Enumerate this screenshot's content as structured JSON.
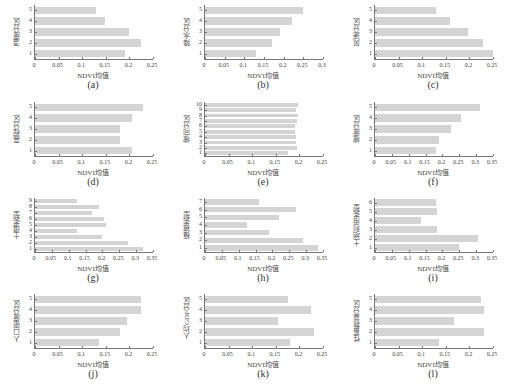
{
  "chart_data": [
    {
      "id": "a",
      "type": "bar",
      "orientation": "horizontal",
      "caption": "(a)",
      "ylabel": "温度分区",
      "xlabel": "NDVI均值",
      "xlim": [
        0,
        0.25
      ],
      "xticks": [
        "0",
        "0.05",
        "0.1",
        "0.15",
        "0.2",
        "0.25"
      ],
      "categories": [
        "1",
        "2",
        "3",
        "4",
        "5"
      ],
      "values": [
        0.19,
        0.225,
        0.2,
        0.148,
        0.13
      ]
    },
    {
      "id": "b",
      "type": "bar",
      "orientation": "horizontal",
      "caption": "(b)",
      "ylabel": "降水分区",
      "xlabel": "NDVI均值",
      "xlim": [
        0,
        0.3
      ],
      "xticks": [
        "0",
        "0.05",
        "0.1",
        "0.15",
        "0.2",
        "0.25",
        "0.3"
      ],
      "categories": [
        "1",
        "2",
        "3",
        "4",
        "5"
      ],
      "values": [
        0.13,
        0.17,
        0.19,
        0.22,
        0.25
      ]
    },
    {
      "id": "c",
      "type": "bar",
      "orientation": "horizontal",
      "caption": "(c)",
      "ylabel": "风速分区",
      "xlabel": "NDVI均值",
      "xlim": [
        0,
        0.25
      ],
      "xticks": [
        "0",
        "0.05",
        "0.1",
        "0.15",
        "0.2",
        "0.25"
      ],
      "categories": [
        "1",
        "2",
        "3",
        "4",
        "5"
      ],
      "values": [
        0.25,
        0.228,
        0.198,
        0.158,
        0.13
      ]
    },
    {
      "id": "d",
      "type": "bar",
      "orientation": "horizontal",
      "caption": "(d)",
      "ylabel": "高程分区",
      "xlabel": "NDVI均值",
      "xlim": [
        0,
        0.25
      ],
      "xticks": [
        "0",
        "0.05",
        "0.1",
        "0.15",
        "0.2",
        "0.25"
      ],
      "categories": [
        "1",
        "2",
        "3",
        "4",
        "5"
      ],
      "values": [
        0.205,
        0.18,
        0.18,
        0.205,
        0.228
      ]
    },
    {
      "id": "e",
      "type": "bar",
      "orientation": "horizontal",
      "caption": "(e)",
      "ylabel": "坡向分区",
      "xlabel": "NDVI均值",
      "xlim": [
        0,
        0.25
      ],
      "xticks": [
        "0",
        "0.05",
        "0.1",
        "0.15",
        "0.2",
        "0.25"
      ],
      "categories": [
        "1",
        "2",
        "3",
        "4",
        "5",
        "6",
        "7",
        "8",
        "9",
        "10"
      ],
      "values": [
        0.175,
        0.195,
        0.192,
        0.193,
        0.19,
        0.19,
        0.195,
        0.198,
        0.192,
        0.198
      ]
    },
    {
      "id": "f",
      "type": "bar",
      "orientation": "horizontal",
      "caption": "(f)",
      "ylabel": "坡度分区",
      "xlabel": "NDVI均值",
      "xlim": [
        0,
        0.35
      ],
      "xticks": [
        "0",
        "0.05",
        "0.1",
        "0.15",
        "0.2",
        "0.25",
        "0.3",
        "0.35"
      ],
      "categories": [
        "1",
        "2",
        "3",
        "4",
        "5"
      ],
      "values": [
        0.18,
        0.19,
        0.225,
        0.255,
        0.31
      ]
    },
    {
      "id": "g",
      "type": "bar",
      "orientation": "horizontal",
      "caption": "(g)",
      "ylabel": "土壤类型",
      "xlabel": "NDVI均值",
      "xlim": [
        0,
        0.35
      ],
      "xticks": [
        "0",
        "0.05",
        "0.1",
        "0.15",
        "0.2",
        "0.25",
        "0.3",
        "0.35"
      ],
      "categories": [
        "1",
        "2",
        "3",
        "4",
        "5",
        "6",
        "7",
        "8",
        "9"
      ],
      "values": [
        0.32,
        0.275,
        0.2,
        0.125,
        0.21,
        0.205,
        0.17,
        0.19,
        0.125
      ]
    },
    {
      "id": "h",
      "type": "bar",
      "orientation": "horizontal",
      "caption": "(h)",
      "ylabel": "植被类型",
      "xlabel": "NDVI均值",
      "xlim": [
        0,
        0.35
      ],
      "xticks": [
        "0",
        "0.05",
        "0.1",
        "0.15",
        "0.2",
        "0.25",
        "0.3",
        "0.35"
      ],
      "categories": [
        "1",
        "2",
        "3",
        "4",
        "5",
        "6",
        "7"
      ],
      "values": [
        0.335,
        0.29,
        0.19,
        0.125,
        0.22,
        0.27,
        0.16
      ]
    },
    {
      "id": "i",
      "type": "bar",
      "orientation": "horizontal",
      "caption": "(i)",
      "ylabel": "土地利用类型",
      "xlabel": "NDVI均值",
      "xlim": [
        0,
        0.35
      ],
      "xticks": [
        "0",
        "0.05",
        "0.1",
        "0.15",
        "0.2",
        "0.25",
        "0.3",
        "0.35"
      ],
      "categories": [
        "1",
        "2",
        "3",
        "4",
        "5",
        "6"
      ],
      "values": [
        0.25,
        0.305,
        0.185,
        0.135,
        0.185,
        0.18
      ]
    },
    {
      "id": "j",
      "type": "bar",
      "orientation": "horizontal",
      "caption": "(j)",
      "ylabel": "人口密度分区",
      "xlabel": "NDVI均值",
      "xlim": [
        0,
        0.25
      ],
      "xticks": [
        "0",
        "0.05",
        "0.1",
        "0.15",
        "0.2",
        "0.25"
      ],
      "categories": [
        "1",
        "2",
        "3",
        "4",
        "5"
      ],
      "values": [
        0.135,
        0.18,
        0.195,
        0.225,
        0.225
      ]
    },
    {
      "id": "k",
      "type": "bar",
      "orientation": "horizontal",
      "caption": "(k)",
      "ylabel": "人均GDP分区",
      "xlabel": "NDVI均值",
      "xlim": [
        0,
        0.25
      ],
      "xticks": [
        "0",
        "0.05",
        "0.1",
        "0.15",
        "0.2",
        "0.25"
      ],
      "categories": [
        "1",
        "2",
        "3",
        "4",
        "5"
      ],
      "values": [
        0.18,
        0.23,
        0.155,
        0.225,
        0.175
      ]
    },
    {
      "id": "l",
      "type": "bar",
      "orientation": "horizontal",
      "caption": "(l)",
      "ylabel": "性畜数量分区",
      "xlabel": "NDVI均值",
      "xlim": [
        0,
        0.25
      ],
      "xticks": [
        "0",
        "0.05",
        "0.1",
        "0.15",
        "0.2",
        "0.25"
      ],
      "categories": [
        "1",
        "2",
        "3",
        "4",
        "5"
      ],
      "values": [
        0.135,
        0.23,
        0.168,
        0.23,
        0.225
      ]
    }
  ],
  "style": {
    "bar_color": "#d4d4d4",
    "axis_color": "#777777"
  }
}
